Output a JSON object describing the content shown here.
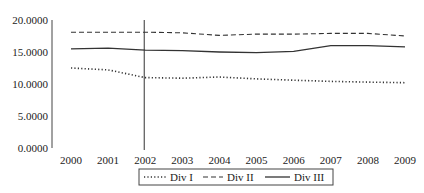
{
  "chart_data": {
    "type": "line",
    "title": "",
    "xlabel": "",
    "ylabel": "",
    "categories": [
      "2000",
      "2001",
      "2002",
      "2003",
      "2004",
      "2005",
      "2006",
      "2007",
      "2008",
      "2009"
    ],
    "yticks": [
      "0.0000",
      "5.0000",
      "10.0000",
      "15.0000",
      "20.0000"
    ],
    "ylim": [
      0,
      20
    ],
    "grid": false,
    "legend_position": "bottom",
    "annotations": [
      {
        "type": "vertical-line",
        "x": "2002"
      }
    ],
    "series": [
      {
        "name": "Div I",
        "style": "dotted",
        "values": [
          12.5,
          12.2,
          11.0,
          10.9,
          11.1,
          10.8,
          10.6,
          10.4,
          10.3,
          10.2
        ]
      },
      {
        "name": "Div II",
        "style": "dashed",
        "values": [
          18.1,
          18.1,
          18.1,
          18.0,
          17.6,
          17.8,
          17.8,
          17.9,
          17.9,
          17.5
        ]
      },
      {
        "name": "Div III",
        "style": "solid",
        "values": [
          15.5,
          15.6,
          15.3,
          15.2,
          15.0,
          14.9,
          15.1,
          16.0,
          16.0,
          15.8
        ]
      }
    ]
  }
}
